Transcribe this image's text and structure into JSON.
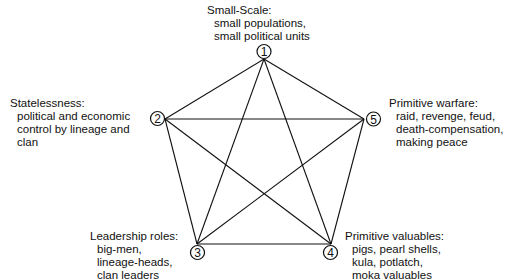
{
  "diagram": {
    "type": "complete-graph-pentagon",
    "nodes": [
      {
        "id": "1",
        "number": "1",
        "title": "Small-Scale:",
        "details": [
          "small populations,",
          "small political units"
        ]
      },
      {
        "id": "2",
        "number": "2",
        "title": "Statelessness:",
        "details": [
          "political and economic",
          "control by lineage and",
          "clan"
        ]
      },
      {
        "id": "3",
        "number": "3",
        "title": "Leadership roles:",
        "details": [
          "big-men,",
          "lineage-heads,",
          "clan leaders"
        ]
      },
      {
        "id": "4",
        "number": "4",
        "title": "Primitive valuables:",
        "details": [
          "pigs, pearl shells,",
          "kula, potlatch,",
          "moka valuables"
        ]
      },
      {
        "id": "5",
        "number": "5",
        "title": "Primitive warfare:",
        "details": [
          "raid, revenge, feud,",
          "death-compensation,",
          "making peace"
        ]
      }
    ],
    "edges": [
      [
        "1",
        "2"
      ],
      [
        "1",
        "3"
      ],
      [
        "1",
        "4"
      ],
      [
        "1",
        "5"
      ],
      [
        "2",
        "3"
      ],
      [
        "2",
        "4"
      ],
      [
        "2",
        "5"
      ],
      [
        "3",
        "4"
      ],
      [
        "3",
        "5"
      ],
      [
        "4",
        "5"
      ]
    ],
    "line_color": "#111111"
  }
}
